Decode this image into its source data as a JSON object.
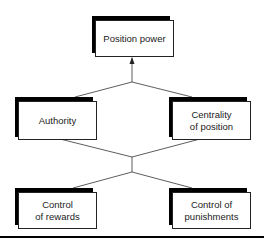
{
  "diagram": {
    "nodes": [
      {
        "id": "position-power",
        "label": "Position power"
      },
      {
        "id": "authority",
        "label": "Authority"
      },
      {
        "id": "centrality-of-position",
        "label": "Centrality\nof position"
      },
      {
        "id": "control-of-rewards",
        "label": "Control\nof rewards"
      },
      {
        "id": "control-of-punishments",
        "label": "Control of\npunishments"
      }
    ],
    "edges": [
      {
        "from": "authority",
        "to": "position-power"
      },
      {
        "from": "centrality-of-position",
        "to": "position-power"
      },
      {
        "from": "control-of-rewards",
        "to": "authority"
      },
      {
        "from": "control-of-rewards",
        "to": "centrality-of-position"
      },
      {
        "from": "control-of-punishments",
        "to": "authority"
      },
      {
        "from": "control-of-punishments",
        "to": "centrality-of-position"
      }
    ],
    "colors": {
      "line": "#222222",
      "shadow": "#000000",
      "box": "#ffffff"
    }
  }
}
